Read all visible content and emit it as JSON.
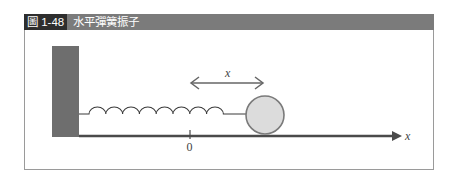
{
  "figure": {
    "number": "圖 1-48",
    "title": "水平彈簧振子"
  },
  "diagram": {
    "displacement_label": "x",
    "axis_label": "x",
    "origin_label": "0",
    "colors": {
      "title_bar": "#7b7b7b",
      "title_number_bg": "#2e2e2e",
      "wall": "#6e6e6e",
      "ball_fill": "#dcdcdc",
      "ball_stroke": "#7a7a7a",
      "axis": "#4a4a4a",
      "spring": "#3a3a3a"
    },
    "elements": [
      "wall",
      "spring",
      "ball",
      "displacement-arrow",
      "x-axis",
      "origin-tick"
    ]
  }
}
